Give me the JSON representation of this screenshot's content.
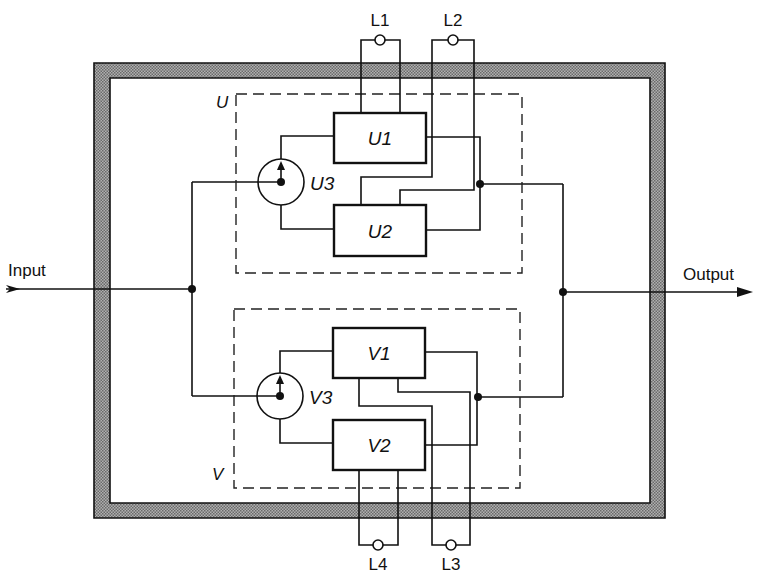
{
  "diagram": {
    "type": "redundant-block-diagram",
    "input_label": "Input",
    "output_label": "Output",
    "groups": [
      {
        "id": "U",
        "label": "U",
        "blocks": [
          "U1",
          "U2"
        ],
        "switch": "U3",
        "lamps": [
          "L1",
          "L2"
        ]
      },
      {
        "id": "V",
        "label": "V",
        "blocks": [
          "V1",
          "V2"
        ],
        "switch": "V3",
        "lamps": [
          "L4",
          "L3"
        ]
      }
    ],
    "blocks": {
      "u1": "U1",
      "u2": "U2",
      "u3": "U3",
      "v1": "V1",
      "v2": "V2",
      "v3": "V3"
    },
    "group_labels": {
      "u": "U",
      "v": "V"
    },
    "lamps": {
      "l1": "L1",
      "l2": "L2",
      "l3": "L3",
      "l4": "L4"
    },
    "colors": {
      "line": "#111111",
      "enclosure_fill": "#9a9a9a",
      "background": "#ffffff"
    }
  }
}
